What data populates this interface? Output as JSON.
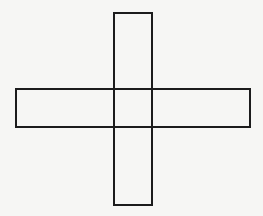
{
  "diagram": {
    "background": "#f6f6f4",
    "stroke_color": "#1c1c1c",
    "stroke_width": 2,
    "shapes": [
      {
        "name": "vertical-rectangle",
        "x": 114,
        "y": 13,
        "width": 38,
        "height": 192
      },
      {
        "name": "horizontal-rectangle",
        "x": 16,
        "y": 89,
        "width": 234,
        "height": 38
      }
    ]
  }
}
